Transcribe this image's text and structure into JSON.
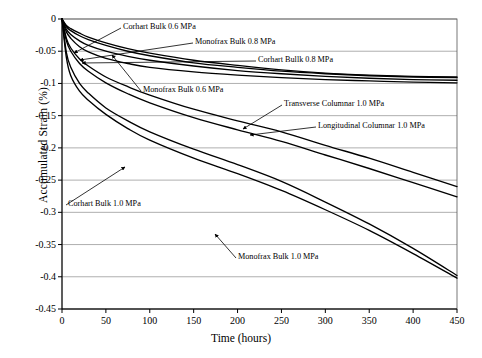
{
  "chart_data": {
    "type": "line",
    "title": "",
    "xlabel": "Time (hours)",
    "ylabel": "Accumulated Strain (%)",
    "xlim": [
      0,
      450
    ],
    "ylim": [
      -0.45,
      0
    ],
    "xticks": [
      "0",
      "50",
      "100",
      "150",
      "200",
      "250",
      "300",
      "350",
      "400",
      "450"
    ],
    "yticks": [
      "0",
      "-0.05",
      "-0.1",
      "-0.15",
      "-0.2",
      "-0.25",
      "-0.3",
      "-0.35",
      "-0.4",
      "-0.45"
    ],
    "grid": "horizontal",
    "legend_position": "inline-annotations",
    "series": [
      {
        "name": "Corhart Bulk 0.6 MPa",
        "x": [
          0,
          5,
          10,
          20,
          30,
          50,
          75,
          100,
          150,
          200,
          250,
          300,
          350,
          400,
          450
        ],
        "values": [
          0,
          -0.012,
          -0.018,
          -0.026,
          -0.032,
          -0.041,
          -0.05,
          -0.057,
          -0.068,
          -0.075,
          -0.081,
          -0.085,
          -0.088,
          -0.09,
          -0.091
        ]
      },
      {
        "name": "Monofrax Bulk 0.8 MPa",
        "x": [
          0,
          5,
          10,
          20,
          30,
          50,
          75,
          100,
          150,
          200,
          250,
          300,
          350,
          400,
          450
        ],
        "values": [
          0,
          -0.01,
          -0.015,
          -0.022,
          -0.028,
          -0.037,
          -0.046,
          -0.053,
          -0.064,
          -0.072,
          -0.079,
          -0.084,
          -0.087,
          -0.089,
          -0.09
        ]
      },
      {
        "name": "Corhart Bullk 0.8 MPa",
        "x": [
          0,
          5,
          10,
          20,
          30,
          50,
          75,
          100,
          150,
          200,
          250,
          300,
          350,
          400,
          450
        ],
        "values": [
          0,
          -0.016,
          -0.024,
          -0.034,
          -0.041,
          -0.05,
          -0.058,
          -0.064,
          -0.073,
          -0.08,
          -0.085,
          -0.089,
          -0.092,
          -0.094,
          -0.095
        ]
      },
      {
        "name": "Monofrax Bulk 0.6 MPa",
        "x": [
          0,
          5,
          10,
          20,
          30,
          50,
          75,
          100,
          150,
          200,
          250,
          300,
          350,
          400,
          450
        ],
        "values": [
          0,
          -0.02,
          -0.03,
          -0.043,
          -0.051,
          -0.061,
          -0.069,
          -0.075,
          -0.082,
          -0.087,
          -0.091,
          -0.094,
          -0.096,
          -0.098,
          -0.099
        ]
      },
      {
        "name": "Transverse Columnar 1.0 MPa",
        "x": [
          0,
          5,
          10,
          20,
          30,
          50,
          75,
          100,
          150,
          200,
          250,
          300,
          350,
          400,
          450
        ],
        "values": [
          0,
          -0.03,
          -0.045,
          -0.062,
          -0.073,
          -0.09,
          -0.105,
          -0.118,
          -0.14,
          -0.158,
          -0.175,
          -0.196,
          -0.216,
          -0.238,
          -0.26
        ]
      },
      {
        "name": "Longitudinal Columnar 1.0 MPa",
        "x": [
          0,
          5,
          10,
          20,
          30,
          50,
          75,
          100,
          150,
          200,
          250,
          300,
          350,
          400,
          450
        ],
        "values": [
          0,
          -0.034,
          -0.05,
          -0.069,
          -0.081,
          -0.099,
          -0.116,
          -0.13,
          -0.153,
          -0.172,
          -0.19,
          -0.211,
          -0.232,
          -0.254,
          -0.276
        ]
      },
      {
        "name": "Corhart Bulk 1.0 MPa",
        "x": [
          0,
          5,
          10,
          20,
          30,
          50,
          75,
          100,
          150,
          200,
          250,
          300,
          350,
          400,
          450
        ],
        "values": [
          0,
          -0.052,
          -0.075,
          -0.1,
          -0.115,
          -0.138,
          -0.158,
          -0.175,
          -0.202,
          -0.226,
          -0.252,
          -0.284,
          -0.318,
          -0.356,
          -0.398
        ]
      },
      {
        "name": "Monofrax Bulk 1.0 MPa",
        "x": [
          0,
          5,
          10,
          20,
          30,
          50,
          75,
          100,
          150,
          200,
          250,
          300,
          350,
          400,
          450
        ],
        "values": [
          0,
          -0.06,
          -0.088,
          -0.112,
          -0.126,
          -0.148,
          -0.17,
          -0.188,
          -0.216,
          -0.24,
          -0.266,
          -0.296,
          -0.328,
          -0.364,
          -0.402
        ]
      }
    ],
    "annotations": [
      {
        "text": "Corhart Bulk 0.6 MPa",
        "lx": 123,
        "ly": 24,
        "ax": 74,
        "ay": 53
      },
      {
        "text": "Monofrax Bulk 0.8 MPa",
        "lx": 195,
        "ly": 39,
        "ax": 80,
        "ay": 60
      },
      {
        "text": "Corhart Bullk 0.8 MPa",
        "lx": 258,
        "ly": 57,
        "ax": 82,
        "ay": 63
      },
      {
        "text": "Monofrax Bulk 0.6 MPa",
        "lx": 143,
        "ly": 87,
        "ax": 112,
        "ay": 55
      },
      {
        "text": "Transverse Columnar 1.0 MPa",
        "lx": 284,
        "ly": 101,
        "ax": 243,
        "ay": 129
      },
      {
        "text": "Longitudinal Columnar 1.0 MPa",
        "lx": 318,
        "ly": 123,
        "ax": 250,
        "ay": 135
      },
      {
        "text": "Corhart Bulk 1.0 MPa",
        "lx": 68,
        "ly": 201,
        "ax": 125,
        "ay": 167
      },
      {
        "text": "Monofrax Bulk 1.0 MPa",
        "lx": 238,
        "ly": 254,
        "ax": 215,
        "ay": 234
      }
    ]
  }
}
